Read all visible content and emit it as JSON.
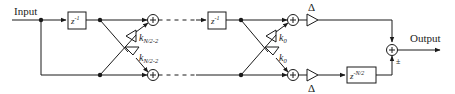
{
  "diagram": {
    "type": "signal-flow block diagram",
    "input_label": "Input",
    "output_label": "Output",
    "stages": [
      {
        "delay_label": "z",
        "delay_exponent": "-1",
        "coefficient_top": "k",
        "coefficient_top_sub": "N/2-2",
        "coefficient_bottom": "k",
        "coefficient_bottom_sub": "N/2-2"
      },
      {
        "delay_label": "z",
        "delay_exponent": "-1",
        "coefficient_top": "k",
        "coefficient_top_sub": "0",
        "coefficient_bottom": "k",
        "coefficient_bottom_sub": "0"
      }
    ],
    "gain_top_label": "Δ",
    "gain_bottom_label": "Δ",
    "final_delay_label": "z",
    "final_delay_exponent": "-N/2",
    "final_adder_sign": "±",
    "colors": {
      "line": "#1a1a1a",
      "background": "#ffffff"
    }
  }
}
